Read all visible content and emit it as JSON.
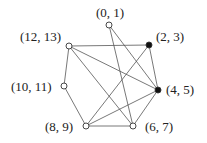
{
  "nodes": [
    {
      "id": "n01",
      "label": "(0, 1)",
      "x": 109,
      "y": 25,
      "filled": false,
      "lx": 96,
      "ly": 17
    },
    {
      "id": "n23",
      "label": "(2, 3)",
      "x": 149,
      "y": 45,
      "filled": true,
      "lx": 156,
      "ly": 41
    },
    {
      "id": "n45",
      "label": "(4, 5)",
      "x": 158,
      "y": 90,
      "filled": true,
      "lx": 166,
      "ly": 94
    },
    {
      "id": "n67",
      "label": "(6, 7)",
      "x": 133,
      "y": 126,
      "filled": false,
      "lx": 145,
      "ly": 131
    },
    {
      "id": "n89",
      "label": "(8, 9)",
      "x": 86,
      "y": 126,
      "filled": false,
      "lx": 45,
      "ly": 131
    },
    {
      "id": "n1011",
      "label": "(10, 11)",
      "x": 64,
      "y": 86,
      "filled": false,
      "lx": 11,
      "ly": 91
    },
    {
      "id": "n1213",
      "label": "(12, 13)",
      "x": 69,
      "y": 46,
      "filled": false,
      "lx": 20,
      "ly": 41
    }
  ],
  "edges": [
    [
      "n01",
      "n45"
    ],
    [
      "n01",
      "n67"
    ],
    [
      "n1213",
      "n23"
    ],
    [
      "n1213",
      "n45"
    ],
    [
      "n1213",
      "n67"
    ],
    [
      "n1213",
      "n1011"
    ],
    [
      "n1011",
      "n89"
    ],
    [
      "n89",
      "n23"
    ],
    [
      "n89",
      "n45"
    ],
    [
      "n89",
      "n67"
    ],
    [
      "n23",
      "n45"
    ],
    [
      "n45",
      "n67"
    ]
  ]
}
